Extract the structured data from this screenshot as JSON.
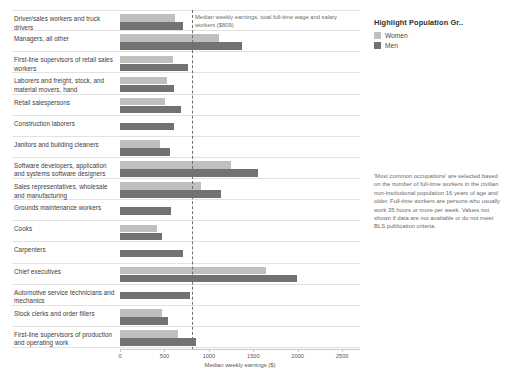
{
  "legend": {
    "title": "Highlight Population Gr..",
    "items": [
      {
        "label": "Women",
        "color": "#bfbfbf",
        "name": "women"
      },
      {
        "label": "Men",
        "color": "#727272",
        "name": "men"
      }
    ]
  },
  "annotations": {
    "reference_line": "Median weekly earnings, total full-time wage and salary workers ($809)",
    "footnote": "'Most common occupations' are selected based on the number of full-time workers in the civilian non-institutional population 16 years of age and older. Full-time workers are persons who usually work 35 hours or more per week. Values not shown if data are not available or do not meet BLS publication criteria."
  },
  "chart_data": {
    "type": "bar",
    "orientation": "horizontal",
    "title": "",
    "xlabel": "Median weekly earnings ($)",
    "ylabel": "",
    "xlim": [
      0,
      2700
    ],
    "xticks": [
      0,
      500,
      1000,
      1500,
      2000,
      2500
    ],
    "xtick_labels": [
      "0",
      "500",
      "1000",
      "1500",
      "2000",
      "2500"
    ],
    "grid": false,
    "legend_position": "right",
    "reference_line_value": 809,
    "categories": [
      "Driver/sales workers and truck drivers",
      "Managers, all other",
      "First-line supervisors of retail sales workers",
      "Laborers and freight, stock, and material movers, hand",
      "Retail salespersons",
      "Construction laborers",
      "Janitors and building cleaners",
      "Software developers, application and systems software designers",
      "Sales representatives, wholesale and manufacturing",
      "Grounds maintenance workers",
      "Cooks",
      "Carpenters",
      "Chief executives",
      "Automotive service technicians and mechanics",
      "Stock clerks and order fillers",
      "First-line supervisors of production and operating work"
    ],
    "series": [
      {
        "name": "Women",
        "color": "#bfbfbf",
        "values": [
          617,
          1115,
          601,
          525,
          511,
          null,
          451,
          1249,
          906,
          null,
          414,
          null,
          1639,
          null,
          475,
          650
        ]
      },
      {
        "name": "Men",
        "color": "#727272",
        "values": [
          714,
          1375,
          762,
          608,
          684,
          609,
          562,
          1548,
          1135,
          570,
          473,
          714,
          1994,
          791,
          540,
          854
        ]
      }
    ]
  }
}
